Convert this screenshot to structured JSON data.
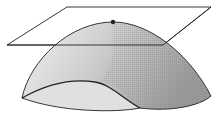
{
  "diagram": {
    "elements": {
      "surface": "dome surface",
      "plane": "tangent plane",
      "point": "maximum point"
    },
    "colors": {
      "stroke": "#222222",
      "surface_light": "#f2f2f2",
      "surface_mid": "#cfcfcf",
      "surface_dark": "#9a9a9a",
      "underside": "#e0e0e0"
    }
  }
}
